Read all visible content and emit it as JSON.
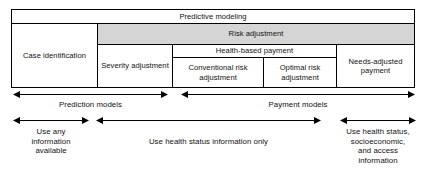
{
  "diagram": {
    "colors": {
      "shaded_fill": "#d5d5d5",
      "line": "#000000",
      "background": "#ffffff",
      "text": "#111111"
    },
    "table": {
      "rows": [
        {
          "cells": [
            {
              "label": "Predictive modeling",
              "shaded": false
            }
          ]
        },
        {
          "cells": [
            {
              "label": "Case identification",
              "shaded": false
            },
            {
              "label": "Risk adjustment",
              "shaded": true
            }
          ]
        },
        {
          "cells": [
            {
              "label": "Severity adjustment",
              "shaded": false
            },
            {
              "label": "Health-based payment",
              "shaded": false
            },
            {
              "label": "Needs-adjusted payment",
              "shaded": false
            }
          ]
        },
        {
          "cells": [
            {
              "label": "Conventional risk adjustment",
              "shaded": false
            },
            {
              "label": "Optimal risk adjustment",
              "shaded": false
            }
          ]
        }
      ],
      "cell_text": {
        "predictive_modeling": "Predictive modeling",
        "case_identification": "Case identification",
        "risk_adjustment": "Risk adjustment",
        "severity_adjustment": "Severity adjustment",
        "health_based_payment": "Health-based payment",
        "conventional_risk_adjustment": "Conventional risk adjustment",
        "optimal_risk_adjustment": "Optimal risk adjustment",
        "needs_adjusted_payment": "Needs-adjusted payment"
      }
    },
    "arrow_groups": [
      {
        "name": "model-type",
        "arrows": [
          {
            "label": "Prediction models",
            "double_headed": true
          },
          {
            "label": "Payment models",
            "double_headed": true
          }
        ]
      },
      {
        "name": "information-used",
        "arrows": [
          {
            "label": "Use any information available",
            "double_headed": true
          },
          {
            "label": "Use health status information only",
            "double_headed": true
          },
          {
            "label": "Use health status, socioeconomic, and access information",
            "double_headed": true
          }
        ]
      }
    ],
    "arrow_labels": {
      "prediction_models": "Prediction models",
      "payment_models": "Payment models",
      "use_any_information_available": "Use any\ninformation\navailable",
      "use_health_status_only": "Use health status information only",
      "use_health_status_socioeconomic_access": "Use health status,\nsocioeconomic,\nand access\ninformation"
    }
  }
}
